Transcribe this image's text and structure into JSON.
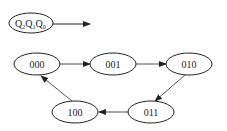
{
  "legend": {
    "label": "Q",
    "subs": [
      "2",
      "1",
      "0"
    ]
  },
  "states": [
    {
      "id": "s000",
      "label": "000",
      "cx": 37,
      "cy": 64
    },
    {
      "id": "s001",
      "label": "001",
      "cx": 113,
      "cy": 64
    },
    {
      "id": "s010",
      "label": "010",
      "cx": 189,
      "cy": 64
    },
    {
      "id": "s011",
      "label": "011",
      "cx": 151,
      "cy": 112
    },
    {
      "id": "s100",
      "label": "100",
      "cx": 75,
      "cy": 112
    }
  ],
  "transitions": [
    {
      "from": "000",
      "to": "001"
    },
    {
      "from": "001",
      "to": "010"
    },
    {
      "from": "010",
      "to": "011"
    },
    {
      "from": "011",
      "to": "100"
    },
    {
      "from": "100",
      "to": "000"
    }
  ],
  "colors": {
    "stroke": "#222222",
    "background": "#ffffff"
  }
}
